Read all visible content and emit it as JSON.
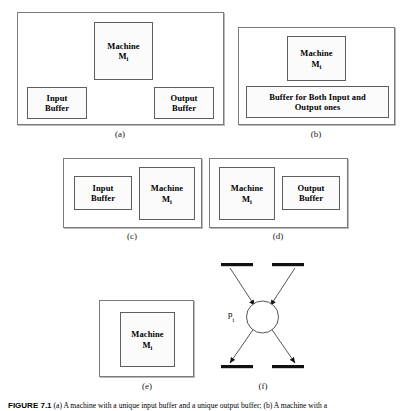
{
  "figure": {
    "caption_label": "FIGURE 7.1",
    "caption_text": "(a) A machine with a unique input buffer and a unique output buffer; (b) A machine with a",
    "background_color": "#ffffff",
    "ink_color": "#000000",
    "box_border_color": "#5e5e5e",
    "frame_border_color": "#7b7b7b",
    "stipple_dot_color": "#8c8c8c"
  },
  "diagrams": {
    "a": {
      "caption": "(a)",
      "machine": {
        "line1": "Machine",
        "line2_base": "M",
        "line2_sub": "i"
      },
      "input_buffer": {
        "line1": "Input",
        "line2": "Buffer"
      },
      "output_buffer": {
        "line1": "Output",
        "line2": "Buffer"
      }
    },
    "b": {
      "caption": "(b)",
      "machine": {
        "line1": "Machine",
        "line2_base": "M",
        "line2_sub": "i"
      },
      "shared_buffer": {
        "line1": "Buffer for Both Input and",
        "line2": "Output ones"
      }
    },
    "c": {
      "caption": "(c)",
      "input_buffer": {
        "line1": "Input",
        "line2": "Buffer"
      },
      "machine": {
        "line1": "Machine",
        "line2_base": "M",
        "line2_sub": "i"
      }
    },
    "d": {
      "caption": "(d)",
      "machine": {
        "line1": "Machine",
        "line2_base": "M",
        "line2_sub": "i"
      },
      "output_buffer": {
        "line1": "Output",
        "line2": "Buffer"
      }
    },
    "e": {
      "caption": "(e)",
      "machine": {
        "line1": "Machine",
        "line2_base": "M",
        "line2_sub": "i"
      }
    },
    "f": {
      "caption": "(f)",
      "place_label_base": "p",
      "place_label_sub": "i",
      "transitions_in": 2,
      "transitions_out": 2
    }
  }
}
